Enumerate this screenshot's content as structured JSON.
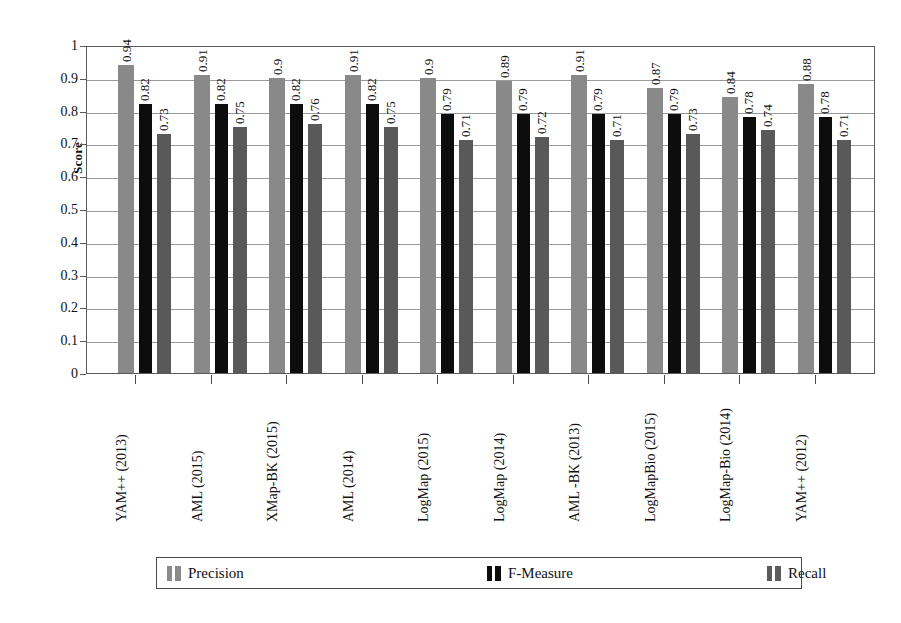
{
  "chart_data": {
    "type": "bar",
    "title": "",
    "subtitle": "",
    "xlabel": "",
    "ylabel": "Score",
    "ylim": [
      0,
      1
    ],
    "ytick_step": 0.1,
    "grid": true,
    "legend_position": "bottom",
    "orientation": "vertical",
    "grouped": true,
    "categories": [
      "YAM++ (2013)",
      "AML  (2015)",
      "XMap-BK (2015)",
      "AML  (2014)",
      "LogMap  (2015)",
      "LogMap  (2014)",
      "AML -BK (2013)",
      "LogMapBio  (2015)",
      "LogMap-Bio  (2014)",
      "YAM++ (2012)"
    ],
    "ytick_labels": [
      "1",
      "0.9",
      "0.8",
      "0.7",
      "0.6",
      "0.5",
      "0.4",
      "0.3",
      "0.2",
      "0.1",
      "0"
    ],
    "ytick_values": [
      1,
      0.9,
      0.8,
      0.7,
      0.6,
      0.5,
      0.4,
      0.3,
      0.2,
      0.1,
      0
    ],
    "series": [
      {
        "name": "Precision",
        "color": "#898989",
        "values": [
          0.94,
          0.91,
          0.9,
          0.91,
          0.9,
          0.89,
          0.91,
          0.87,
          0.84,
          0.88
        ],
        "labels": [
          "0.94",
          "0.91",
          "0.9",
          "0.91",
          "0.9",
          "0.89",
          "0.91",
          "0.87",
          "0.84",
          "0.88"
        ]
      },
      {
        "name": "F-Measure",
        "color": "#0d0d0d",
        "values": [
          0.82,
          0.82,
          0.82,
          0.82,
          0.79,
          0.79,
          0.79,
          0.79,
          0.78,
          0.78
        ],
        "labels": [
          "0.82",
          "0.82",
          "0.82",
          "0.82",
          "0.79",
          "0.79",
          "0.79",
          "0.79",
          "0.78",
          "0.78"
        ]
      },
      {
        "name": "Recall",
        "color": "#595959",
        "values": [
          0.73,
          0.75,
          0.76,
          0.75,
          0.71,
          0.72,
          0.71,
          0.73,
          0.74,
          0.71
        ],
        "labels": [
          "0.73",
          "0.75",
          "0.76",
          "0.75",
          "0.71",
          "0.72",
          "0.71",
          "0.73",
          "0.74",
          "0.71"
        ]
      }
    ]
  },
  "legend": {
    "items": [
      {
        "label": "Precision",
        "color": "#8b8b8b"
      },
      {
        "label": "F-Measure",
        "color": "#0d0d0d"
      },
      {
        "label": "Recall",
        "color": "#5b5b5b"
      }
    ]
  },
  "axis": {
    "y_title": "Score"
  }
}
